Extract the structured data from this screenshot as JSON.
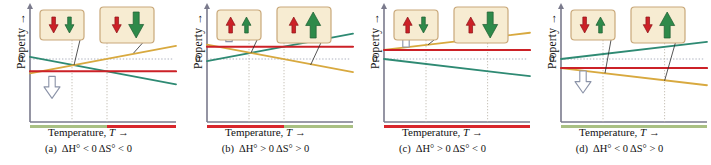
{
  "figure": {
    "axis": {
      "ylabel": "Property  →",
      "xlabel": "Temperature, T →",
      "zero_tick": "0"
    },
    "curve_labels": {
      "gibbs": "ΔG°",
      "enthalpy": "ΔH°",
      "entropy": "TΔS°"
    },
    "colors": {
      "gibbs": "#d8a93f",
      "enthalpy": "#cc2127",
      "entropy": "#2e8a73",
      "spontaneous_bar": "#a9c083",
      "nonspontaneous_bar": "#d8262c",
      "box_fill": "#f7ecd2",
      "box_border": "#c9a87a",
      "arrow_red": "#cc2127",
      "arrow_green": "#2e8a4a",
      "axis": "#7a7a8c",
      "hollow_arrow_stroke": "#8b93a8"
    }
  },
  "panels": [
    {
      "tag": "(a)",
      "condition_h": "ΔH° < 0",
      "condition_s": "ΔS° < 0",
      "labels": {
        "gibbs": "ΔG°",
        "enthalpy": "ΔH°",
        "entropy": "TΔS°"
      },
      "box_left": {
        "red_arrow": "down",
        "green_arrow": "down",
        "red_size": "small",
        "green_size": "small"
      },
      "box_right": {
        "red_arrow": "down",
        "green_arrow": "down",
        "red_size": "small",
        "green_size": "large"
      },
      "hollow_arrow": "down",
      "bar_low_temp": "spontaneous",
      "bar_high_temp": "nonspontaneous",
      "gibbs_trend": "rising",
      "entropy_trend": "falling",
      "enthalpy_sign": "negative"
    },
    {
      "tag": "(b)",
      "condition_h": "ΔH° > 0",
      "condition_s": "ΔS° > 0",
      "labels": {
        "gibbs": "ΔG°",
        "enthalpy": "ΔH°",
        "entropy": "TΔS°"
      },
      "box_left": {
        "red_arrow": "up",
        "green_arrow": "up",
        "red_size": "small",
        "green_size": "small"
      },
      "box_right": {
        "red_arrow": "up",
        "green_arrow": "up",
        "red_size": "small",
        "green_size": "large"
      },
      "hollow_arrow": "up",
      "bar_low_temp": "nonspontaneous",
      "bar_high_temp": "spontaneous",
      "gibbs_trend": "falling",
      "entropy_trend": "rising",
      "enthalpy_sign": "positive"
    },
    {
      "tag": "(c)",
      "condition_h": "ΔH° > 0",
      "condition_s": "ΔS° < 0",
      "labels": {
        "gibbs": "ΔG°",
        "enthalpy": "ΔH°",
        "entropy": "TΔS°"
      },
      "box_left": {
        "red_arrow": "up",
        "green_arrow": "down",
        "red_size": "small",
        "green_size": "small"
      },
      "box_right": {
        "red_arrow": "up",
        "green_arrow": "down",
        "red_size": "small",
        "green_size": "large"
      },
      "hollow_arrow": "up",
      "bar_low_temp": "nonspontaneous",
      "bar_high_temp": "nonspontaneous",
      "gibbs_trend": "rising",
      "entropy_trend": "falling",
      "enthalpy_sign": "positive"
    },
    {
      "tag": "(d)",
      "condition_h": "ΔH° < 0",
      "condition_s": "ΔS° > 0",
      "labels": {
        "gibbs": "ΔG°",
        "enthalpy": "ΔH°",
        "entropy": "TΔS°"
      },
      "box_left": {
        "red_arrow": "down",
        "green_arrow": "up",
        "red_size": "small",
        "green_size": "small"
      },
      "box_right": {
        "red_arrow": "down",
        "green_arrow": "up",
        "red_size": "small",
        "green_size": "large"
      },
      "hollow_arrow": "down",
      "bar_low_temp": "spontaneous",
      "bar_high_temp": "spontaneous",
      "gibbs_trend": "falling",
      "entropy_trend": "rising",
      "enthalpy_sign": "negative"
    }
  ],
  "chart_data": {
    "type": "line",
    "title": "",
    "xlabel": "Temperature, T →",
    "ylabel": "Property →",
    "x": [
      0,
      1
    ],
    "panels": [
      {
        "name": "(a)",
        "series": [
          {
            "name": "ΔH°",
            "values": [
              -0.3,
              -0.3
            ],
            "color": "#cc2127"
          },
          {
            "name": "TΔS°",
            "values": [
              0.05,
              -0.62
            ],
            "color": "#2e8a73"
          },
          {
            "name": "ΔG°",
            "values": [
              -0.35,
              0.32
            ],
            "color": "#d8a93f"
          }
        ],
        "crossover_x": 0.55,
        "spontaneity": [
          "spontaneous",
          "nonspontaneous"
        ]
      },
      {
        "name": "(b)",
        "series": [
          {
            "name": "ΔH°",
            "values": [
              0.3,
              0.3
            ],
            "color": "#cc2127"
          },
          {
            "name": "TΔS°",
            "values": [
              -0.05,
              0.62
            ],
            "color": "#2e8a73"
          },
          {
            "name": "ΔG°",
            "values": [
              0.35,
              -0.32
            ],
            "color": "#d8a93f"
          }
        ],
        "crossover_x": 0.55,
        "spontaneity": [
          "nonspontaneous",
          "spontaneous"
        ]
      },
      {
        "name": "(c)",
        "series": [
          {
            "name": "ΔH°",
            "values": [
              0.22,
              0.22
            ],
            "color": "#cc2127"
          },
          {
            "name": "TΔS°",
            "values": [
              0.0,
              -0.42
            ],
            "color": "#2e8a73"
          },
          {
            "name": "ΔG°",
            "values": [
              0.22,
              0.64
            ],
            "color": "#d8a93f"
          }
        ],
        "crossover_x": null,
        "spontaneity": [
          "nonspontaneous",
          "nonspontaneous"
        ]
      },
      {
        "name": "(d)",
        "series": [
          {
            "name": "ΔH°",
            "values": [
              -0.22,
              -0.22
            ],
            "color": "#cc2127"
          },
          {
            "name": "TΔS°",
            "values": [
              0.0,
              0.42
            ],
            "color": "#2e8a73"
          },
          {
            "name": "ΔG°",
            "values": [
              -0.22,
              -0.64
            ],
            "color": "#d8a93f"
          }
        ],
        "crossover_x": null,
        "spontaneity": [
          "spontaneous",
          "spontaneous"
        ]
      }
    ],
    "legend": [
      "ΔG°",
      "ΔH°",
      "TΔS°"
    ],
    "grid": false
  }
}
